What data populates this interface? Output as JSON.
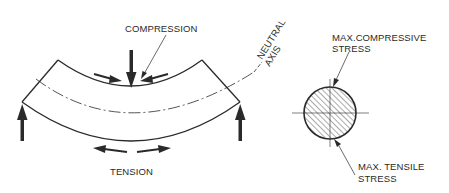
{
  "diagram": {
    "beam": {
      "labels": {
        "compression": "COMPRESSION",
        "tension": "TENSION",
        "neutral_axis_line1": "NEUTRAL",
        "neutral_axis_line2": "AXIS"
      }
    },
    "cross_section": {
      "labels": {
        "max_compressive_line1": "MAX.COMPRESSIVE",
        "max_compressive_line2": "STRESS",
        "max_tensile_line1": "MAX. TENSILE",
        "max_tensile_line2": "STRESS"
      }
    },
    "colors": {
      "line": "#2a2a2a",
      "background": "#ffffff"
    }
  }
}
